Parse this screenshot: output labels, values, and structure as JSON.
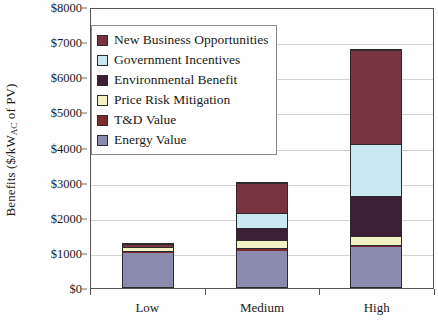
{
  "chart_data": {
    "type": "bar",
    "subtype": "stacked-bar",
    "title": "",
    "xlabel": "",
    "ylabel": "Benefits ($/kWAC of PV)",
    "ylabel_parts": {
      "pre": "Benefits ($/kW",
      "sub": "AC",
      "post": " of PV)"
    },
    "categories": [
      "Low",
      "Medium",
      "High"
    ],
    "ylim": [
      0,
      8000
    ],
    "ytick_values": [
      0,
      1000,
      2000,
      3000,
      4000,
      5000,
      6000,
      7000,
      8000
    ],
    "ytick_labels": [
      "$0",
      "$1000",
      "$2000",
      "$3000",
      "$4000",
      "$5000",
      "$6000",
      "$7000",
      "$8000"
    ],
    "grid": true,
    "grid_axis": "y",
    "legend_position": "upper-left-inside",
    "stack_order_bottom_to_top": [
      "Energy Value",
      "T&D Value",
      "Price Risk Mitigation",
      "Environmental Benefit",
      "Government Incentives",
      "New Business Opportunities"
    ],
    "series": [
      {
        "name": "New Business Opportunities",
        "color": "#7a3340",
        "values": [
          90,
          860,
          2680
        ]
      },
      {
        "name": "Government Incentives",
        "color": "#c9e8ef",
        "values": [
          0,
          430,
          1500
        ]
      },
      {
        "name": "Environmental Benefit",
        "color": "#3d1f35",
        "values": [
          0,
          370,
          1150
        ]
      },
      {
        "name": "Price Risk Mitigation",
        "color": "#f2f1c4",
        "values": [
          120,
          230,
          250
        ]
      },
      {
        "name": "T&D Value",
        "color": "#7c2b31",
        "values": [
          40,
          70,
          80
        ]
      },
      {
        "name": "Energy Value",
        "color": "#8b8bb0",
        "values": [
          1030,
          1050,
          1140
        ]
      }
    ],
    "totals": [
      1280,
      3010,
      6800
    ]
  },
  "legend": {
    "items": [
      {
        "label": "New Business Opportunities",
        "color": "#7a3340"
      },
      {
        "label": "Government Incentives",
        "color": "#c9e8ef"
      },
      {
        "label": "Environmental Benefit",
        "color": "#3d1f35"
      },
      {
        "label": "Price Risk Mitigation",
        "color": "#f2f1c4"
      },
      {
        "label": "T&D Value",
        "color": "#7c2b31"
      },
      {
        "label": "Energy Value",
        "color": "#8b8bb0"
      }
    ]
  },
  "axis_colors": {
    "frame": "#555555",
    "gridline": "#d3d3d3",
    "segment_border": "#2b2b2b"
  }
}
